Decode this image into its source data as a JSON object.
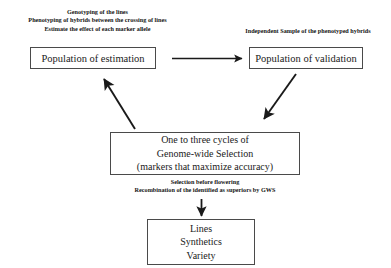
{
  "diagram": {
    "stroke_color": "#1a1a1a",
    "box_border_color": "#4a4a4a",
    "background_color": "#ffffff",
    "captions": {
      "estimation": [
        "Genotyping of the lines",
        "Phenotyping of hybrids between the crossing of lines",
        "Estimate the effect of each marker allele"
      ],
      "validation": [
        "Independent Sample of the phenotyped hybrids"
      ],
      "selection": [
        "Selection before flowering",
        "Recombination of the identified  as superiors by GWS"
      ]
    },
    "boxes": {
      "estimation": {
        "lines": [
          "Population of estimation"
        ]
      },
      "validation": {
        "lines": [
          "Population of validation"
        ]
      },
      "gws": {
        "lines": [
          "One to three cycles of",
          "Genome-wide Selection",
          "(markers that maximize  accuracy)"
        ]
      },
      "outputs": {
        "lines": [
          "Lines",
          "Synthetics",
          "Variety"
        ]
      }
    },
    "arrows": [
      {
        "name": "estimation-to-validation",
        "direction": "right"
      },
      {
        "name": "gws-to-estimation",
        "direction": "up-left"
      },
      {
        "name": "validation-to-gws",
        "direction": "down-left"
      },
      {
        "name": "gws-to-outputs",
        "direction": "down"
      }
    ]
  }
}
